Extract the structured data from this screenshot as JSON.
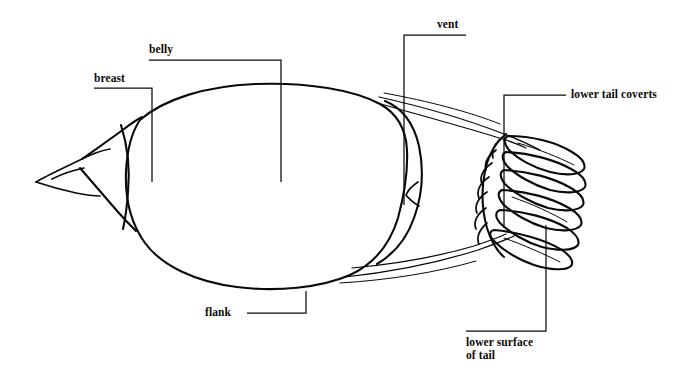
{
  "figure": {
    "background_color": "#ffffff",
    "ink_color": "#0a0a0a",
    "width": 686,
    "height": 380
  },
  "labels": [
    {
      "id": "breast",
      "text": "breast",
      "x": 94,
      "y": 72,
      "align": "left"
    },
    {
      "id": "belly",
      "text": "belly",
      "x": 149,
      "y": 43,
      "align": "left"
    },
    {
      "id": "vent",
      "text": "vent",
      "x": 437,
      "y": 18,
      "align": "left"
    },
    {
      "id": "lower-tail-coverts",
      "text": "lower tail coverts",
      "x": 571,
      "y": 88,
      "align": "left"
    },
    {
      "id": "flank",
      "text": "flank",
      "x": 205,
      "y": 306,
      "align": "left"
    },
    {
      "id": "lower-surface-of-tail",
      "text": "lower surface\nof tail",
      "x": 466,
      "y": 336,
      "align": "left"
    }
  ]
}
